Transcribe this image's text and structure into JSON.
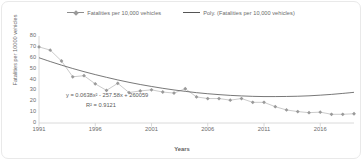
{
  "chart_data": {
    "type": "line",
    "title": "",
    "xlabel": "Years",
    "ylabel": "Fatalities per 10000 vehicles",
    "xlim": [
      1991,
      2019
    ],
    "ylim": [
      0,
      80
    ],
    "ytick_labels": [
      "80",
      "70",
      "60",
      "50",
      "40",
      "30",
      "20",
      "10",
      "0"
    ],
    "yticks": [
      80,
      70,
      60,
      50,
      40,
      30,
      20,
      10,
      0
    ],
    "xtick_labels": [
      "1991",
      "1996",
      "2001",
      "2006",
      "2011",
      "2016"
    ],
    "xticks": [
      1991,
      1996,
      2001,
      2006,
      2011,
      2016
    ],
    "grid": false,
    "legend_position": "top",
    "legend": [
      "Fatalities per 10,000 vehicles",
      "Poly. (Fatalities per 10,000 vehicles)"
    ],
    "annotations": [
      "y = 0.0638x² - 257.58x + 260059",
      "R² = 0.9121"
    ],
    "x": [
      1991,
      1992,
      1993,
      1994,
      1995,
      1996,
      1997,
      1998,
      1999,
      2000,
      2001,
      2002,
      2003,
      2004,
      2005,
      2006,
      2007,
      2008,
      2009,
      2010,
      2011,
      2012,
      2013,
      2014,
      2015,
      2016,
      2017,
      2018,
      2019
    ],
    "series": [
      {
        "name": "Fatalities per 10,000 vehicles",
        "type": "line-marker",
        "color": "#9a9a9a",
        "values": [
          70,
          67,
          57,
          42.5,
          43.5,
          36,
          30,
          36.5,
          28,
          29.5,
          30.5,
          28.5,
          27.5,
          31.5,
          24,
          22.5,
          22.5,
          21,
          22.5,
          19,
          19,
          15,
          12,
          10.5,
          9.5,
          10,
          8,
          8,
          8.5
        ]
      },
      {
        "name": "Poly. (Fatalities per 10,000 vehicles)",
        "type": "trendline",
        "color": "#555555",
        "values": [
          60,
          56.5,
          53.2,
          50.1,
          47.2,
          44.5,
          42,
          39.6,
          37.4,
          35.4,
          33.6,
          31.9,
          30.4,
          29.1,
          27.9,
          26.9,
          26.1,
          25.4,
          24.9,
          24.5,
          24.3,
          24.3,
          24.4,
          24.6,
          25.0,
          25.6,
          26.3,
          27.2,
          28.2
        ]
      }
    ]
  },
  "accent_colors": {
    "marker": "#9a9a9a",
    "series_line": "#b5b5b5",
    "trendline": "#555555",
    "axis": "#d0d0d0",
    "text": "#6b6b6b",
    "border": "#e9e9e9"
  }
}
